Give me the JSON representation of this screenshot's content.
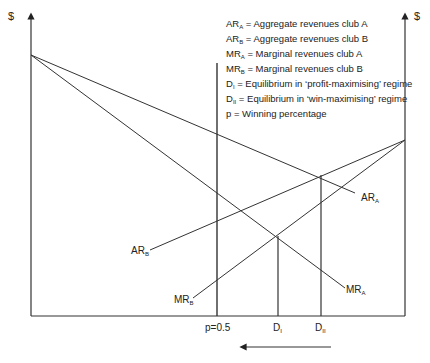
{
  "axes": {
    "left_label": "$",
    "right_label": "$"
  },
  "legend": [
    {
      "sym": "AR",
      "sub": "A",
      "text": " = Aggregate revenues club A"
    },
    {
      "sym": "AR",
      "sub": "B",
      "text": " = Aggregate revenues club B"
    },
    {
      "sym": "MR",
      "sub": "A",
      "text": " = Marginal revenues club A"
    },
    {
      "sym": "MR",
      "sub": "B",
      "text": " = Marginal revenues club B"
    },
    {
      "sym": "D",
      "sub": "I",
      "text": " = Equilibrium in ‘profit-maximising’ regime"
    },
    {
      "sym": "D",
      "sub": "II",
      "text": " = Equilibrium in ‘win-maximising’ regime"
    },
    {
      "sym": "p",
      "sub": "",
      "text": " = Winning percentage"
    }
  ],
  "curve_labels": {
    "ar_a": {
      "sym": "AR",
      "sub": "A"
    },
    "ar_b": {
      "sym": "AR",
      "sub": "B"
    },
    "mr_a": {
      "sym": "MR",
      "sub": "A"
    },
    "mr_b": {
      "sym": "MR",
      "sub": "B"
    }
  },
  "x_labels": {
    "p": "p=0.5",
    "d1": {
      "sym": "D",
      "sub": "I"
    },
    "d2": {
      "sym": "D",
      "sub": "II"
    }
  }
}
